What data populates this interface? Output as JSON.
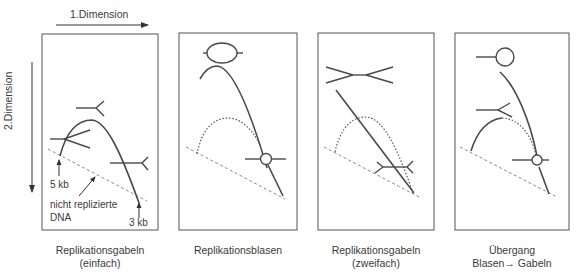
{
  "axes": {
    "x_label": "1.Dimension",
    "y_label": "2.Dimension"
  },
  "colors": {
    "stroke": "#4a4a4a",
    "dashed": "#8a8a8a",
    "border": "#555555"
  },
  "panels": [
    {
      "id": "panel-1",
      "caption_line1": "Replikationsgabeln",
      "caption_line2": "(einfach)",
      "annotations": {
        "label_5kb": "5 kb",
        "label_3kb": "3 kb",
        "label_unreplicated_1": "nicht replizierte",
        "label_unreplicated_2": "DNA"
      },
      "icons": [
        "fork-icon",
        "fork-icon",
        "fork-icon"
      ]
    },
    {
      "id": "panel-2",
      "caption_line1": "Replikationsblasen",
      "caption_line2": "",
      "icons": [
        "bubble-large-icon",
        "bubble-small-icon"
      ]
    },
    {
      "id": "panel-3",
      "caption_line1": "Replikationsgabeln",
      "caption_line2": "(zweifach)",
      "icons": [
        "double-fork-icon",
        "double-fork-icon"
      ]
    },
    {
      "id": "panel-4",
      "caption_line1": "Übergang",
      "caption_line2": "Blasen→  Gabeln",
      "icons": [
        "bubble-large-icon",
        "fork-icon",
        "bubble-small-icon"
      ]
    }
  ]
}
